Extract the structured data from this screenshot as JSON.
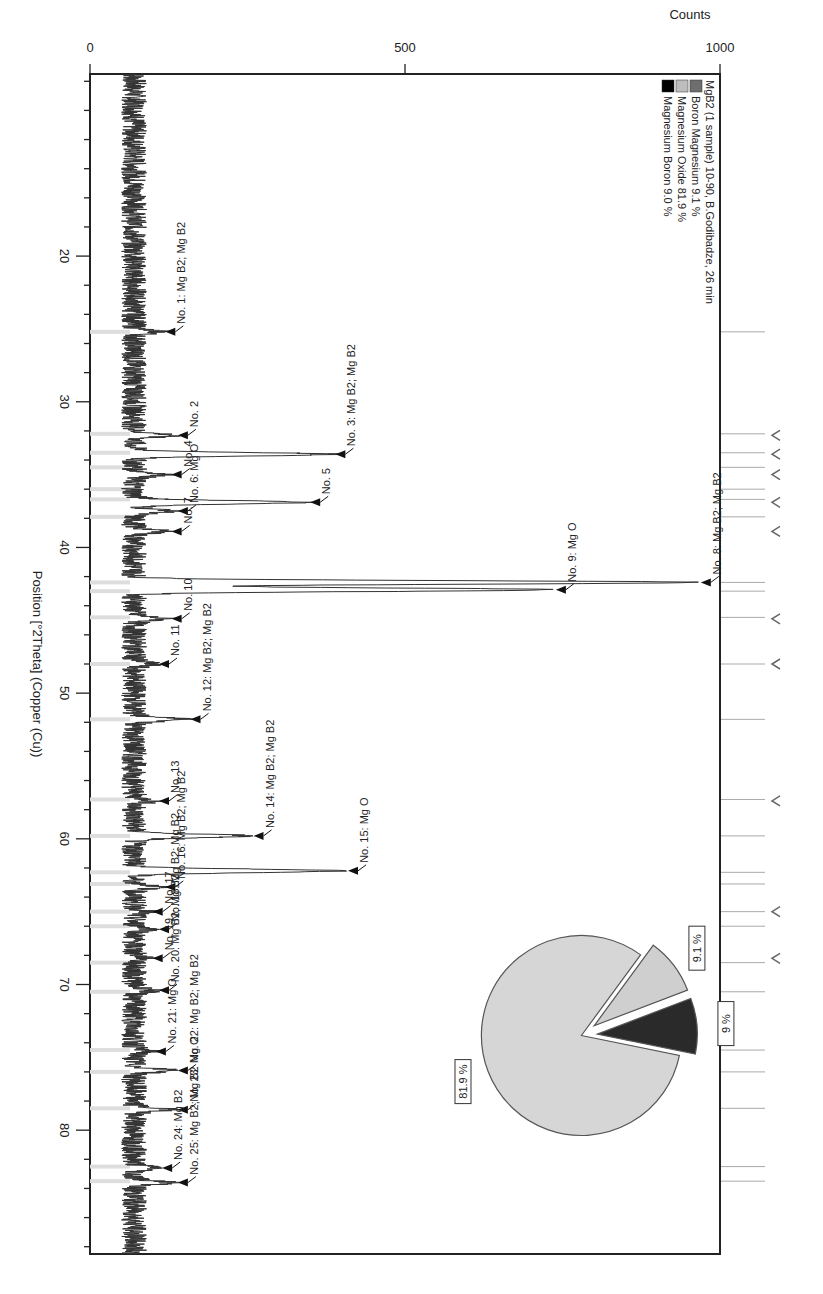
{
  "chart_data": {
    "type": "line",
    "title": "MgB2 (1 sample) 10-90,  B.Godibadze, 26 min",
    "xlabel": "Position [°2Theta] (Copper (Cu))",
    "ylabel": "Counts",
    "xlim": [
      7.5,
      88.5
    ],
    "ylim": [
      0,
      1000
    ],
    "x_ticks": [
      20,
      30,
      40,
      50,
      60,
      70,
      80
    ],
    "y_ticks": [
      0,
      500,
      1000
    ],
    "orientation": "rotated 90° clockwise (2Theta axis runs bottom-to-top along right edge; Counts axis runs right-to-left)",
    "baseline_counts": 70,
    "legend": [
      {
        "label": "MgB2 (1 sample) 10-90,  B.Godibadze, 26 min",
        "color": null
      },
      {
        "label": "Boron Magnesium 9.1 %",
        "color": "#6e6e6e"
      },
      {
        "label": "Magnesium Oxide 81.9 %",
        "color": "#bdbdbd"
      },
      {
        "label": "Magnesium Boron 9.0 %",
        "color": "#000000"
      }
    ],
    "peaks": [
      {
        "no": 1,
        "x": 25.2,
        "counts": 110,
        "label": "No. 1: Mg B2; Mg B2"
      },
      {
        "no": 2,
        "x": 32.3,
        "counts": 130,
        "label": "No. 2"
      },
      {
        "no": 3,
        "x": 33.6,
        "counts": 380,
        "label": "No. 3: Mg B2; Mg B2"
      },
      {
        "no": 4,
        "x": 35.0,
        "counts": 120,
        "label": "No. 4"
      },
      {
        "no": 5,
        "x": 36.9,
        "counts": 340,
        "label": "No. 5"
      },
      {
        "no": 6,
        "x": 37.5,
        "counts": 130,
        "label": "No. 6: Mg O"
      },
      {
        "no": 7,
        "x": 38.9,
        "counts": 120,
        "label": "No. 7"
      },
      {
        "no": 8,
        "x": 42.4,
        "counts": 960,
        "label": "No. 8: Mg B2; Mg B2"
      },
      {
        "no": 9,
        "x": 42.9,
        "counts": 730,
        "label": "No. 9: Mg O"
      },
      {
        "no": 10,
        "x": 44.9,
        "counts": 120,
        "label": "No. 10"
      },
      {
        "no": 11,
        "x": 48.0,
        "counts": 100,
        "label": "No. 11"
      },
      {
        "no": 12,
        "x": 51.8,
        "counts": 150,
        "label": "No. 12: Mg B2; Mg B2"
      },
      {
        "no": 13,
        "x": 57.4,
        "counts": 100,
        "label": "No. 13"
      },
      {
        "no": 14,
        "x": 59.8,
        "counts": 250,
        "label": "No. 14: Mg B2; Mg B2"
      },
      {
        "no": 15,
        "x": 62.2,
        "counts": 400,
        "label": "No. 15: Mg O"
      },
      {
        "no": 16,
        "x": 63.3,
        "counts": 110,
        "label": "No. 16: Mg B2; Mg B2"
      },
      {
        "no": 17,
        "x": 65.0,
        "counts": 90,
        "label": "No. 17"
      },
      {
        "no": 18,
        "x": 66.2,
        "counts": 100,
        "label": "No. 18: Mg B2; Mg B2"
      },
      {
        "no": 19,
        "x": 68.2,
        "counts": 90,
        "label": "No. 19"
      },
      {
        "no": 20,
        "x": 70.4,
        "counts": 100,
        "label": "No. 20: Mg B2; Mg B2"
      },
      {
        "no": 21,
        "x": 74.6,
        "counts": 95,
        "label": "No. 21: Mg O"
      },
      {
        "no": 22,
        "x": 75.9,
        "counts": 130,
        "label": "No. 22: Mg B2; Mg B2"
      },
      {
        "no": 23,
        "x": 78.6,
        "counts": 130,
        "label": "No. 23: Mg O"
      },
      {
        "no": 24,
        "x": 82.6,
        "counts": 105,
        "label": "No. 24: Mg B2"
      },
      {
        "no": 25,
        "x": 83.6,
        "counts": 130,
        "label": "No. 25: Mg B2; Mg B2"
      }
    ],
    "reference_lines": [
      25.2,
      32.2,
      33.5,
      34.5,
      36.0,
      36.7,
      37.9,
      42.4,
      43.0,
      44.8,
      48.0,
      51.8,
      57.3,
      59.8,
      62.3,
      63.1,
      65.0,
      66.0,
      68.5,
      70.5,
      74.5,
      76.0,
      78.5,
      82.5,
      83.5
    ],
    "reference_markers_v": [
      32.3,
      33.6,
      35.0,
      36.9,
      38.9,
      44.9,
      48.0,
      57.4,
      65.0,
      68.2
    ],
    "pie": {
      "slices": [
        {
          "label": "Magnesium Oxide",
          "value": 81.9,
          "tag": "81.9 %",
          "color": "#d6d6d6"
        },
        {
          "label": "Boron Magnesium",
          "value": 9.1,
          "tag": "9.1 %",
          "color": "#cfcfcf"
        },
        {
          "label": "Magnesium Boron",
          "value": 9.0,
          "tag": "9 %",
          "color": "#2a2a2a"
        }
      ]
    }
  }
}
